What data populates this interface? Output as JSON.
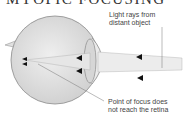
{
  "diagram": {
    "title": "MYOPIC FOCUSING",
    "labels": {
      "light_rays_line1": "Light rays from",
      "light_rays_line2": "distant object",
      "focus_line1": "Point of focus does",
      "focus_line2": "not reach the retina"
    },
    "colors": {
      "eyeball": "#e2e2e2",
      "outline": "#8a8a8a",
      "ray_beam": "#ececec",
      "arrow": "#111111"
    }
  }
}
